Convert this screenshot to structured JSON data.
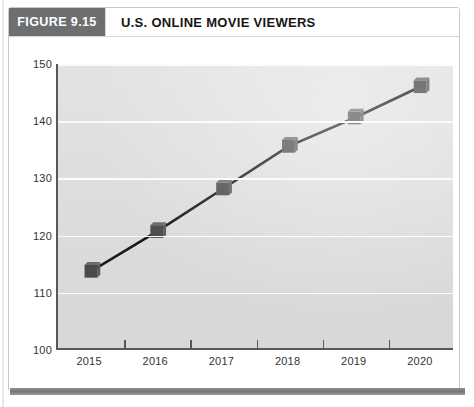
{
  "header": {
    "figure_tag": "FIGURE 9.15",
    "title": "U.S. ONLINE MOVIE VIEWERS"
  },
  "colors": {
    "tag_background": "#6d6e70",
    "tag_text": "#ffffff",
    "plot_background": "#dcdcdc",
    "gridline": "#fbfbfb",
    "axis": "#58585a",
    "series_line": "#1a1a1a",
    "marker_fill": "#4a4a4c",
    "footer_rule": "#76777a"
  },
  "chart_data": {
    "type": "line",
    "title": "U.S. ONLINE MOVIE VIEWERS",
    "subtitle": "",
    "xlabel": "",
    "ylabel": "",
    "categories": [
      "2015",
      "2016",
      "2017",
      "2018",
      "2019",
      "2020"
    ],
    "values": [
      113.5,
      120.5,
      128,
      135.5,
      140.5,
      146
    ],
    "series": [
      {
        "name": "U.S. online movie viewers",
        "values": [
          113.5,
          120.5,
          128,
          135.5,
          140.5,
          146
        ]
      }
    ],
    "ylim": [
      100,
      150
    ],
    "yticks": [
      100,
      110,
      120,
      130,
      140,
      150
    ],
    "ytick_labels": [
      "100",
      "110",
      "120",
      "130",
      "140",
      "150"
    ],
    "xtick_labels": [
      "2015",
      "2016",
      "2017",
      "2018",
      "2019",
      "2020"
    ],
    "grid": true,
    "grid_axis": "y",
    "legend": false,
    "legend_position": "none",
    "marker": "3d-cube",
    "annotations": []
  }
}
